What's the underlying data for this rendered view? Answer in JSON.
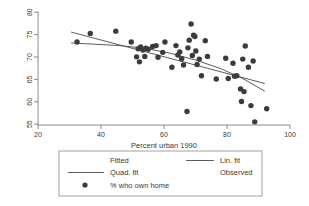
{
  "chart_data": {
    "type": "scatter",
    "title": "",
    "xlabel": "Percent urban 1990",
    "ylabel": "",
    "xlim": [
      20,
      100
    ],
    "ylim": [
      55,
      80
    ],
    "xticks": [
      20,
      40,
      60,
      80,
      100
    ],
    "yticks": [
      55,
      60,
      65,
      70,
      75,
      80
    ],
    "xtick_labels": [
      "20",
      "40",
      "60",
      "80",
      "100"
    ],
    "ytick_labels": [
      "55",
      "60",
      "65",
      "70",
      "75",
      "80"
    ],
    "grid": false,
    "legend_position": "below-plot",
    "series": [
      {
        "name": "% who own home",
        "type": "scatter",
        "marker": "filled-circle",
        "color": "#3b3b3b",
        "points": [
          [
            32.4,
            73.4
          ],
          [
            36.6,
            75.3
          ],
          [
            44.7,
            75.8
          ],
          [
            49.6,
            73.4
          ],
          [
            51.3,
            70.1
          ],
          [
            51.8,
            71.9
          ],
          [
            52.2,
            69.0
          ],
          [
            52.6,
            72.3
          ],
          [
            53.3,
            71.6
          ],
          [
            53.9,
            70.2
          ],
          [
            54.2,
            72.0
          ],
          [
            55.0,
            71.8
          ],
          [
            56.4,
            72.4
          ],
          [
            57.5,
            72.6
          ],
          [
            58.1,
            70.0
          ],
          [
            59.6,
            71.1
          ],
          [
            60.3,
            73.4
          ],
          [
            62.5,
            67.8
          ],
          [
            63.8,
            72.6
          ],
          [
            64.4,
            70.5
          ],
          [
            65.0,
            71.2
          ],
          [
            65.6,
            69.7
          ],
          [
            66.2,
            68.3
          ],
          [
            67.3,
            58.0
          ],
          [
            67.6,
            72.1
          ],
          [
            68.0,
            73.8
          ],
          [
            68.6,
            77.4
          ],
          [
            69.0,
            70.4
          ],
          [
            69.4,
            74.9
          ],
          [
            69.8,
            74.6
          ],
          [
            70.1,
            71.4
          ],
          [
            70.5,
            68.4
          ],
          [
            71.2,
            69.6
          ],
          [
            71.9,
            65.9
          ],
          [
            73.1,
            73.7
          ],
          [
            73.8,
            70.2
          ],
          [
            76.6,
            65.2
          ],
          [
            79.6,
            69.8
          ],
          [
            80.4,
            65.3
          ],
          [
            81.9,
            68.7
          ],
          [
            82.4,
            65.8
          ],
          [
            83.1,
            65.9
          ],
          [
            84.3,
            63.0
          ],
          [
            84.6,
            60.2
          ],
          [
            85.0,
            69.6
          ],
          [
            85.4,
            62.4
          ],
          [
            85.8,
            72.5
          ],
          [
            86.8,
            67.8
          ],
          [
            87.6,
            59.3
          ],
          [
            88.3,
            69.2
          ],
          [
            88.8,
            55.7
          ],
          [
            92.6,
            58.6
          ]
        ]
      },
      {
        "name": "Lin. fit",
        "type": "line",
        "color": "#4a4a4a",
        "points": [
          [
            30.5,
            75.6
          ],
          [
            92.0,
            64.2
          ]
        ]
      },
      {
        "name": "Quad. fit",
        "type": "line",
        "color": "#4a4a4a",
        "points": [
          [
            30.5,
            73.2
          ],
          [
            38.0,
            72.9
          ],
          [
            46.0,
            72.6
          ],
          [
            54.0,
            72.0
          ],
          [
            62.0,
            70.9
          ],
          [
            70.0,
            69.4
          ],
          [
            78.0,
            67.5
          ],
          [
            85.0,
            65.3
          ],
          [
            92.0,
            62.5
          ]
        ]
      }
    ],
    "legend": {
      "col1_header": "Fitted",
      "col2_header": "Observed",
      "entries": [
        {
          "label": "Lin. fit",
          "key": "line"
        },
        {
          "label": "Quad. fit",
          "key": "line"
        },
        {
          "label": "% who own home",
          "key": "marker"
        }
      ]
    }
  }
}
